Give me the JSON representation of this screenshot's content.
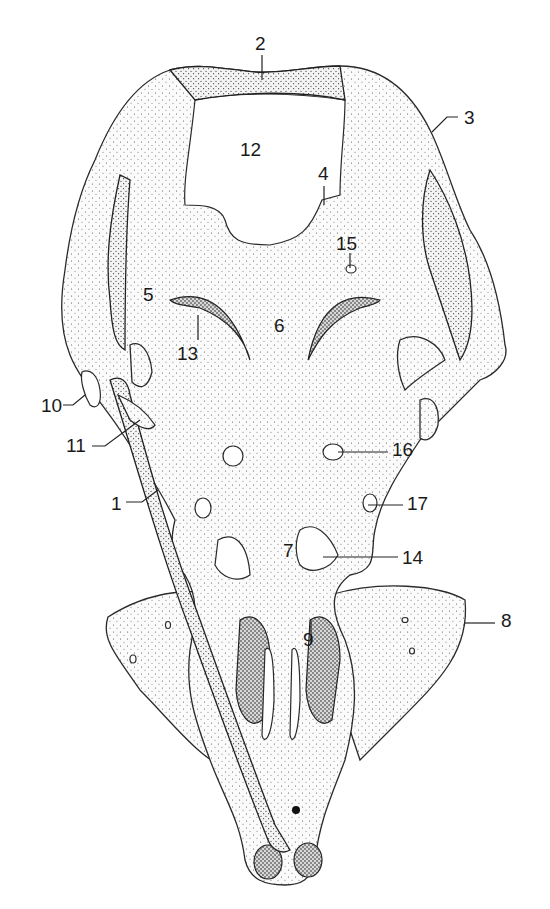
{
  "figure": {
    "type": "anatomical-illustration",
    "view": "ventral view of stippled skull / chondrocranium",
    "colors": {
      "ink": "#1a1a1a",
      "background": "#ffffff"
    }
  },
  "labels": [
    {
      "id": "1",
      "text": "1",
      "x": 111,
      "y": 494
    },
    {
      "id": "2",
      "text": "2",
      "x": 255,
      "y": 34
    },
    {
      "id": "3",
      "text": "3",
      "x": 464,
      "y": 108
    },
    {
      "id": "4",
      "text": "4",
      "x": 318,
      "y": 164
    },
    {
      "id": "5",
      "text": "5",
      "x": 143,
      "y": 285
    },
    {
      "id": "6",
      "text": "6",
      "x": 274,
      "y": 316
    },
    {
      "id": "7",
      "text": "7",
      "x": 283,
      "y": 541
    },
    {
      "id": "8",
      "text": "8",
      "x": 501,
      "y": 611
    },
    {
      "id": "9",
      "text": "9",
      "x": 303,
      "y": 630
    },
    {
      "id": "10",
      "text": "10",
      "x": 41,
      "y": 396
    },
    {
      "id": "11",
      "text": "11",
      "x": 66,
      "y": 436
    },
    {
      "id": "12",
      "text": "12",
      "x": 240,
      "y": 140
    },
    {
      "id": "13",
      "text": "13",
      "x": 177,
      "y": 344
    },
    {
      "id": "14",
      "text": "14",
      "x": 402,
      "y": 548
    },
    {
      "id": "15",
      "text": "15",
      "x": 336,
      "y": 234
    },
    {
      "id": "16",
      "text": "16",
      "x": 392,
      "y": 440
    },
    {
      "id": "17",
      "text": "17",
      "x": 407,
      "y": 494
    }
  ]
}
